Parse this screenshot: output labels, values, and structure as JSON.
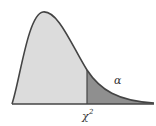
{
  "diagram": {
    "type": "chi-square-distribution",
    "tail_label": "α",
    "critical_label": "χ",
    "critical_superscript": "2",
    "colors": {
      "body_fill": "#dcdcdc",
      "tail_fill": "#8f8f8f",
      "curve": "#444444",
      "axis": "#444444"
    }
  }
}
